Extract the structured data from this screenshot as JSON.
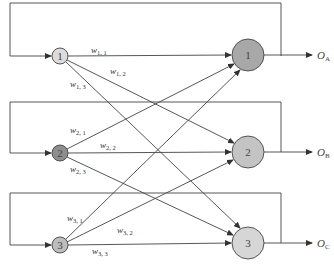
{
  "diagram": {
    "type": "recurrent-network",
    "input_nodes": [
      {
        "id": "1",
        "label": "1",
        "cx": 60,
        "cy": 56,
        "r": 8,
        "fill": "#dcdcdc"
      },
      {
        "id": "2",
        "label": "2",
        "cx": 60,
        "cy": 153,
        "r": 8,
        "fill": "#8e8e8e"
      },
      {
        "id": "3",
        "label": "3",
        "cx": 60,
        "cy": 245,
        "r": 8,
        "fill": "#bdbdbd"
      }
    ],
    "output_nodes": [
      {
        "id": "1",
        "label": "1",
        "cx": 248,
        "cy": 55,
        "r": 16,
        "fill": "#a8a8a8"
      },
      {
        "id": "2",
        "label": "2",
        "cx": 248,
        "cy": 152,
        "r": 16,
        "fill": "#c4c4c4"
      },
      {
        "id": "3",
        "label": "3",
        "cx": 248,
        "cy": 243,
        "r": 16,
        "fill": "#d6d6d6"
      }
    ],
    "outputs": [
      {
        "main": "O",
        "sub": "A"
      },
      {
        "main": "O",
        "sub": "B"
      },
      {
        "main": "O",
        "sub": "C"
      }
    ],
    "weights": [
      {
        "main": "w",
        "sub": "1, 1",
        "x": 86,
        "y": 53
      },
      {
        "main": "w",
        "sub": "1, 2",
        "x": 108,
        "y": 77
      },
      {
        "main": "w",
        "sub": "1, 3",
        "x": 70,
        "y": 89
      },
      {
        "main": "w",
        "sub": "2, 1",
        "x": 70,
        "y": 139
      },
      {
        "main": "w",
        "sub": "2, 2",
        "x": 100,
        "y": 151
      },
      {
        "main": "w",
        "sub": "2, 3",
        "x": 70,
        "y": 175
      },
      {
        "main": "w",
        "sub": "3, 1",
        "x": 68,
        "y": 224
      },
      {
        "main": "w",
        "sub": "3, 2",
        "x": 118,
        "y": 233
      },
      {
        "main": "w",
        "sub": "3, 3",
        "x": 92,
        "y": 254
      }
    ],
    "loop_tops": [
      3,
      102,
      193
    ],
    "loop_left_x": 10,
    "loop_right_x": 281,
    "line_color": "#444444"
  }
}
